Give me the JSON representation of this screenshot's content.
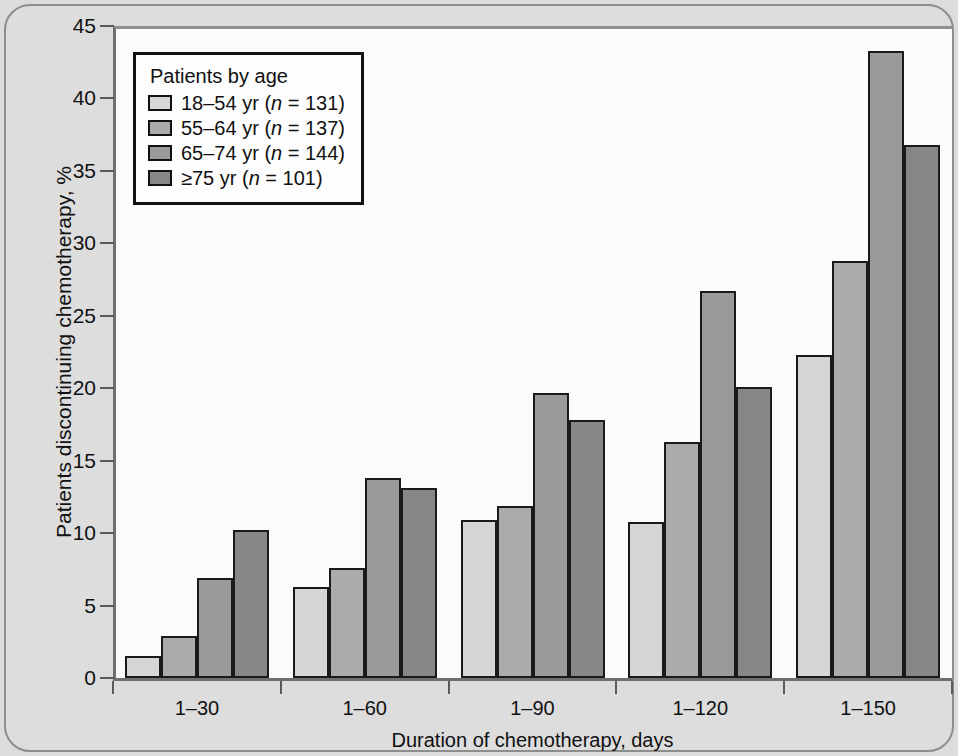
{
  "chart_data": {
    "type": "bar",
    "title": "",
    "subtitle": "",
    "xlabel": "Duration of chemotherapy, days",
    "ylabel": "Patients discontinuing chemotherapy, %",
    "categories": [
      "1–30",
      "1–60",
      "1–90",
      "1–120",
      "1–150"
    ],
    "series": [
      {
        "name": "18–54 yr (n = 131)",
        "short": "18–54 yr",
        "n": 131,
        "color": "#d6d6d6",
        "values": [
          1.5,
          6.3,
          10.9,
          10.8,
          22.3
        ]
      },
      {
        "name": "55–64 yr (n = 137)",
        "short": "55–64 yr",
        "n": 137,
        "color": "#ababab",
        "values": [
          2.9,
          7.6,
          11.9,
          16.3,
          28.8
        ]
      },
      {
        "name": "65–74 yr (n = 144)",
        "short": "65–74 yr",
        "n": 144,
        "color": "#9a9a9a",
        "values": [
          6.9,
          13.8,
          19.7,
          26.7,
          43.3
        ]
      },
      {
        "name": "≥75 yr (n = 101)",
        "short": "≥75 yr",
        "n": 101,
        "color": "#878787",
        "values": [
          10.2,
          13.1,
          17.8,
          20.1,
          36.8
        ]
      }
    ],
    "ylim": [
      0,
      45
    ],
    "ytick_step": 5,
    "yticks": [
      0,
      5,
      10,
      15,
      20,
      25,
      30,
      35,
      40,
      45
    ],
    "ytick_labels": [
      "0",
      "5",
      "10",
      "15",
      "20",
      "25",
      "30",
      "35",
      "40",
      "45"
    ],
    "grid": false,
    "legend_position": "top-left",
    "bar_edge_color": "#1a1a1a"
  },
  "legend": {
    "title": "Patients by age",
    "entries": [
      {
        "range": "18–54 yr",
        "n_prefix": "(",
        "n_symbol": "n",
        "n_eq": " = ",
        "n_value": "131",
        "n_suffix": ")"
      },
      {
        "range": "55–64 yr",
        "n_prefix": "(",
        "n_symbol": "n",
        "n_eq": " = ",
        "n_value": "137",
        "n_suffix": ")"
      },
      {
        "range": "65–74 yr",
        "n_prefix": "(",
        "n_symbol": "n",
        "n_eq": " = ",
        "n_value": "144",
        "n_suffix": ")"
      },
      {
        "range": "≥75 yr",
        "n_prefix": "(",
        "n_symbol": "n",
        "n_eq": " = ",
        "n_value": "101",
        "n_suffix": ")"
      }
    ]
  },
  "axes": {
    "y_title": "Patients discontinuing chemotherapy, %",
    "x_title": "Duration of chemotherapy, days"
  },
  "ghost_text": {
    "col1": "the number of patients who had been shown to be receiving chemotherapy. Specifically, the number of patients discontinuing treatment was higher among older patients receiving combination regimens.",
    "col2": "treatment for colorectal cancer. In patients aged 65 years or more, the rate of discontinuation was considerably higher than in younger patients. These results are consistent with earlier reports indicating that older patients are at increased risk for toxicity during chemotherapy, particularly during the first cycles of treatment."
  }
}
